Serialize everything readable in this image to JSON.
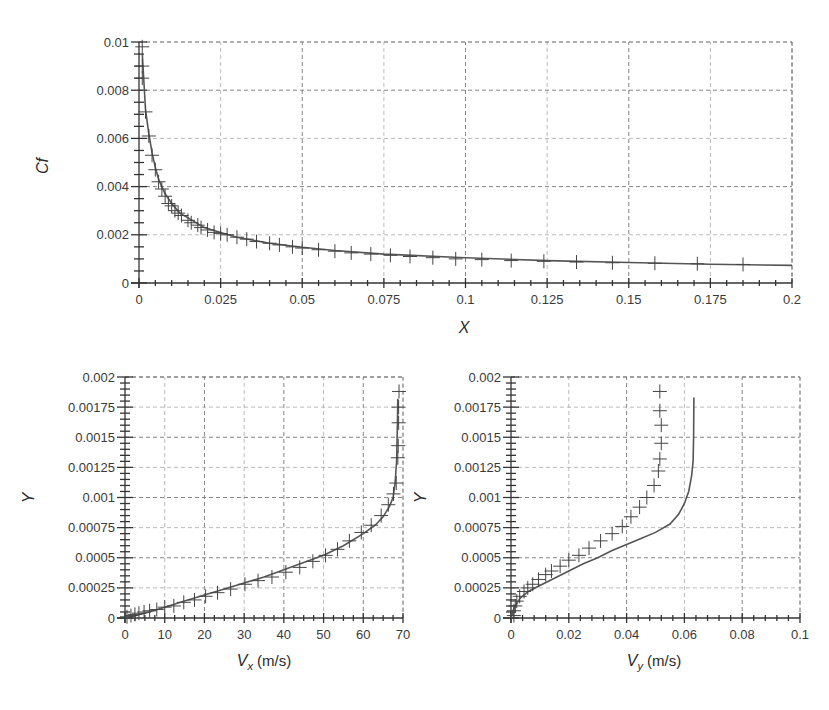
{
  "chart_data": [
    {
      "id": "cf",
      "type": "line",
      "title": "",
      "xlabel": "X",
      "ylabel": "Cf",
      "xlim": [
        0,
        0.2
      ],
      "ylim": [
        0,
        0.01
      ],
      "grid": true,
      "legend": null,
      "xticks": [
        "0",
        "0.025",
        "0.05",
        "0.075",
        "0.1",
        "0.125",
        "0.15",
        "0.175",
        "0.2"
      ],
      "yticks": [
        "0",
        "0.002",
        "0.004",
        "0.006",
        "0.008",
        "0.01"
      ],
      "series": [
        {
          "name": "computed",
          "style": "line",
          "x": [
            0.001,
            0.002,
            0.003,
            0.004,
            0.005,
            0.006,
            0.008,
            0.01,
            0.0125,
            0.015,
            0.02,
            0.025,
            0.03,
            0.04,
            0.05,
            0.06,
            0.075,
            0.1,
            0.125,
            0.15,
            0.175,
            0.2
          ],
          "y": [
            0.0095,
            0.0072,
            0.0062,
            0.0054,
            0.0048,
            0.0043,
            0.0037,
            0.0033,
            0.0029,
            0.0027,
            0.0023,
            0.0021,
            0.0019,
            0.00165,
            0.00148,
            0.00135,
            0.0012,
            0.00105,
            0.00093,
            0.00085,
            0.00078,
            0.00073
          ]
        },
        {
          "name": "reference",
          "style": "plus-markers",
          "x": [
            0.001,
            0.001,
            0.001,
            0.002,
            0.003,
            0.004,
            0.005,
            0.006,
            0.007,
            0.008,
            0.009,
            0.01,
            0.011,
            0.012,
            0.013,
            0.015,
            0.016,
            0.018,
            0.019,
            0.021,
            0.023,
            0.025,
            0.027,
            0.03,
            0.033,
            0.036,
            0.04,
            0.043,
            0.047,
            0.05,
            0.055,
            0.06,
            0.065,
            0.071,
            0.077,
            0.083,
            0.09,
            0.097,
            0.105,
            0.114,
            0.124,
            0.134,
            0.145,
            0.158,
            0.171,
            0.185
          ],
          "y": [
            0.0098,
            0.009,
            0.0085,
            0.0071,
            0.0061,
            0.0053,
            0.0047,
            0.0042,
            0.0039,
            0.0036,
            0.0033,
            0.0032,
            0.003,
            0.0029,
            0.0028,
            0.0026,
            0.0025,
            0.0024,
            0.0023,
            0.0022,
            0.0021,
            0.00205,
            0.002,
            0.0019,
            0.00182,
            0.00172,
            0.00165,
            0.00158,
            0.0015,
            0.00145,
            0.00138,
            0.00132,
            0.00125,
            0.0012,
            0.00115,
            0.0011,
            0.00105,
            0.001,
            0.00097,
            0.00093,
            0.0009,
            0.00087,
            0.00084,
            0.00082,
            0.0008,
            0.00077
          ]
        }
      ]
    },
    {
      "id": "vx",
      "type": "line",
      "title": "",
      "xlabel": "V_x (m/s)",
      "ylabel": "Y",
      "xlim": [
        0,
        70
      ],
      "ylim": [
        0,
        0.002
      ],
      "grid": true,
      "legend": null,
      "xticks": [
        "0",
        "10",
        "20",
        "30",
        "40",
        "50",
        "60",
        "70"
      ],
      "yticks": [
        "0",
        "0.00025",
        "0.0005",
        "0.00075",
        "0.001",
        "0.00125",
        "0.0015",
        "0.00175",
        "0.002"
      ],
      "series": [
        {
          "name": "computed",
          "style": "line",
          "x": [
            0,
            5,
            10,
            15,
            20,
            25,
            30,
            35,
            40,
            45,
            50,
            55,
            60,
            63,
            65,
            66.5,
            67.5,
            68,
            68.4,
            68.6,
            68.7
          ],
          "y": [
            0,
            4e-05,
            9e-05,
            0.00014,
            0.00019,
            0.00024,
            0.00029,
            0.00034,
            0.0004,
            0.00046,
            0.00052,
            0.0006,
            0.0007,
            0.00077,
            0.00084,
            0.00092,
            0.001,
            0.00112,
            0.0013,
            0.0016,
            0.00182
          ]
        },
        {
          "name": "reference",
          "style": "plus-markers",
          "x": [
            0.5,
            1.5,
            2.5,
            3.5,
            4.8,
            6.2,
            8,
            10,
            12.3,
            14.8,
            17.5,
            20.3,
            23.3,
            26.6,
            30.2,
            33.5,
            37,
            40.5,
            44,
            47.3,
            50.5,
            53.5,
            56.5,
            59.5,
            62,
            64.5,
            66.3,
            67.6,
            68.3,
            68.7,
            68.8,
            68.9,
            68.9,
            69
          ],
          "y": [
            1e-05,
            2e-05,
            3e-05,
            4e-05,
            5e-05,
            6e-05,
            7e-05,
            9e-05,
            0.0001,
            0.00013,
            0.00015,
            0.00018,
            0.00021,
            0.00024,
            0.00028,
            0.00031,
            0.00034,
            0.00038,
            0.00042,
            0.00047,
            0.00052,
            0.00057,
            0.00064,
            0.00071,
            0.00077,
            0.00085,
            0.00094,
            0.00103,
            0.00112,
            0.00133,
            0.00143,
            0.00162,
            0.00175,
            0.00188
          ]
        }
      ]
    },
    {
      "id": "vy",
      "type": "line",
      "title": "",
      "xlabel": "V_y (m/s)",
      "ylabel": "Y",
      "xlim": [
        0,
        0.1
      ],
      "ylim": [
        0,
        0.002
      ],
      "grid": true,
      "legend": null,
      "xticks": [
        "0",
        "0.02",
        "0.04",
        "0.06",
        "0.08",
        "0.1"
      ],
      "yticks": [
        "0",
        "0.00025",
        "0.0005",
        "0.00075",
        "0.001",
        "0.00125",
        "0.0015",
        "0.00175",
        "0.002"
      ],
      "series": [
        {
          "name": "computed",
          "style": "line",
          "x": [
            0,
            0.001,
            0.003,
            0.006,
            0.01,
            0.015,
            0.02,
            0.025,
            0.03,
            0.035,
            0.04,
            0.045,
            0.05,
            0.055,
            0.058,
            0.06,
            0.0615,
            0.0625,
            0.063,
            0.0632,
            0.0633
          ],
          "y": [
            0,
            8e-05,
            0.00016,
            0.00022,
            0.00027,
            0.00033,
            0.00039,
            0.00045,
            0.0005,
            0.00056,
            0.00061,
            0.00066,
            0.00071,
            0.00078,
            0.00086,
            0.00095,
            0.00105,
            0.00118,
            0.0013,
            0.0015,
            0.00183
          ]
        },
        {
          "name": "reference",
          "style": "plus-markers",
          "x": [
            0.0515,
            0.0515,
            0.052,
            0.052,
            0.0515,
            0.051,
            0.0495,
            0.047,
            0.0445,
            0.0415,
            0.0385,
            0.035,
            0.031,
            0.027,
            0.0235,
            0.02,
            0.017,
            0.014,
            0.012,
            0.0095,
            0.0075,
            0.0058,
            0.0045,
            0.003,
            0.002,
            0.0015,
            0.001,
            0.001
          ],
          "y": [
            0.00188,
            0.00172,
            0.0016,
            0.00145,
            0.00132,
            0.00122,
            0.0011,
            0.001,
            0.00092,
            0.00084,
            0.00076,
            0.0007,
            0.00064,
            0.00058,
            0.00052,
            0.00048,
            0.00043,
            0.00039,
            0.00036,
            0.00032,
            0.00028,
            0.00025,
            0.00022,
            0.00018,
            0.00014,
            0.0001,
            6e-05,
            2e-05
          ]
        }
      ]
    }
  ],
  "plots": {
    "cf": {
      "ylabel": "Cf",
      "xlabel": "X",
      "xticks": [
        "0",
        "0.025",
        "0.05",
        "0.075",
        "0.1",
        "0.125",
        "0.15",
        "0.175",
        "0.2"
      ],
      "yticks": [
        "0",
        "0.002",
        "0.004",
        "0.006",
        "0.008",
        "0.01"
      ]
    },
    "vx": {
      "ylabel": "Y",
      "xlabel_main": "V",
      "xlabel_sub": "x",
      "xlabel_unit": " (m/s)",
      "xticks": [
        "0",
        "10",
        "20",
        "30",
        "40",
        "50",
        "60",
        "70"
      ],
      "yticks": [
        "0",
        "0.00025",
        "0.0005",
        "0.00075",
        "0.001",
        "0.00125",
        "0.0015",
        "0.00175",
        "0.002"
      ]
    },
    "vy": {
      "ylabel": "Y",
      "xlabel_main": "V",
      "xlabel_sub": "y",
      "xlabel_unit": " (m/s)",
      "xticks": [
        "0",
        "0.02",
        "0.04",
        "0.06",
        "0.08",
        "0.1"
      ],
      "yticks": [
        "0",
        "0.00025",
        "0.0005",
        "0.00075",
        "0.001",
        "0.00125",
        "0.0015",
        "0.00175",
        "0.002"
      ]
    }
  },
  "colors": {
    "curve": "#555555",
    "marker": "#444444",
    "grid_major": "#777777",
    "grid_minor": "#aaaaaa",
    "axis": "#333333"
  }
}
